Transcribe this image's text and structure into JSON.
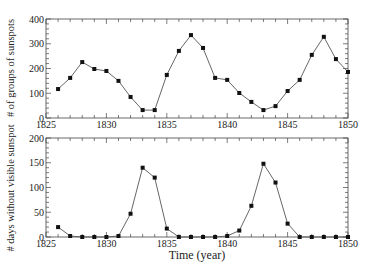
{
  "chart_data": [
    {
      "type": "line",
      "title": "",
      "xlabel": "",
      "ylabel": "# of groups of sunspots",
      "xlim": [
        1825,
        1850
      ],
      "ylim": [
        0,
        400
      ],
      "x_ticks": [
        1825,
        1830,
        1835,
        1840,
        1845,
        1850
      ],
      "y_ticks": [
        0,
        100,
        200,
        300,
        400
      ],
      "grid": false,
      "marker": "filled-square",
      "x": [
        1826,
        1827,
        1828,
        1829,
        1830,
        1831,
        1832,
        1833,
        1834,
        1835,
        1836,
        1837,
        1838,
        1839,
        1840,
        1841,
        1842,
        1843,
        1844,
        1845,
        1846,
        1847,
        1848,
        1849,
        1850
      ],
      "values": [
        117,
        162,
        226,
        198,
        190,
        150,
        85,
        32,
        32,
        174,
        271,
        335,
        283,
        162,
        154,
        101,
        65,
        32,
        48,
        109,
        154,
        255,
        328,
        238,
        186
      ]
    },
    {
      "type": "line",
      "title": "",
      "xlabel": "Time (year)",
      "ylabel": "# days without visible sunspot",
      "xlim": [
        1825,
        1850
      ],
      "ylim": [
        0,
        200
      ],
      "x_ticks": [
        1825,
        1830,
        1835,
        1840,
        1845,
        1850
      ],
      "y_ticks": [
        0,
        50,
        100,
        150,
        200
      ],
      "grid": false,
      "marker": "filled-square",
      "x": [
        1826,
        1827,
        1828,
        1829,
        1830,
        1831,
        1832,
        1833,
        1834,
        1835,
        1836,
        1837,
        1838,
        1839,
        1840,
        1841,
        1842,
        1843,
        1844,
        1845,
        1846,
        1847,
        1848,
        1849,
        1850
      ],
      "values": [
        20,
        2,
        0,
        0,
        0,
        2,
        47,
        140,
        120,
        17,
        0,
        0,
        0,
        0,
        2,
        13,
        63,
        148,
        110,
        27,
        0,
        0,
        0,
        0,
        0
      ]
    }
  ],
  "labels": {
    "top_ylabel": "# of groups of sunspots",
    "bottom_ylabel": "# days without visible sunspot",
    "xlabel": "Time (year)"
  },
  "colors": {
    "line": "#555555",
    "marker": "#111111",
    "axis": "#444444"
  }
}
